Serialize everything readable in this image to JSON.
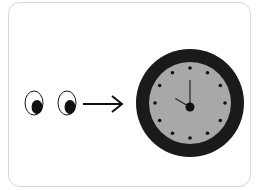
{
  "illustration": {
    "subject": "eyes looking at clock",
    "icons": [
      "left-eye-icon",
      "right-eye-icon",
      "arrow-right-icon",
      "clock-icon"
    ],
    "clock": {
      "hour": 10,
      "minute": 0,
      "hour_markers": 12
    },
    "colors": {
      "background": "#ffffff",
      "card_border": "#d6d6d6",
      "ink": "#111111",
      "clock_rim": "#1a1a1a",
      "clock_face": "#a8a8a8"
    }
  }
}
